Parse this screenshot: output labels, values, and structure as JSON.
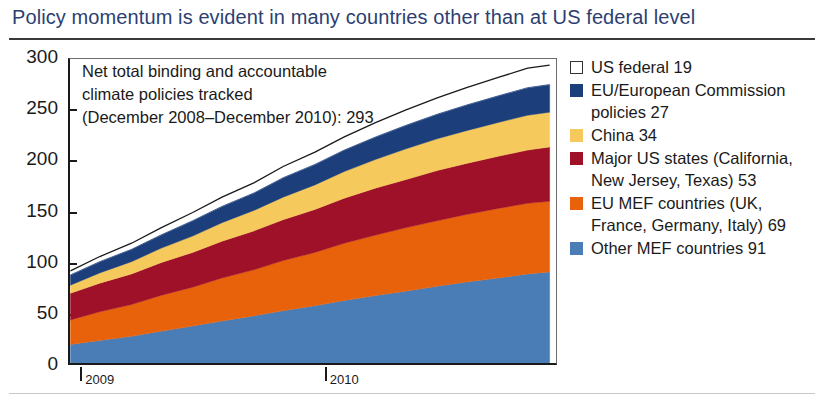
{
  "header": {
    "title": "Policy momentum is evident in many countries other than at US federal level",
    "title_color": "#2d3f72"
  },
  "annotation": {
    "line1": "Net total binding and accountable",
    "line2": "climate policies tracked",
    "line3": "(December 2008–December 2010): 293"
  },
  "legend": {
    "items": [
      {
        "label": "US federal 19",
        "color": "#ffffff",
        "outlined": true,
        "lines": [
          "US federal 19"
        ]
      },
      {
        "label": "EU/European Commission policies 27",
        "color": "#1c3f7c",
        "outlined": false,
        "lines": [
          "EU/European Commission",
          "policies 27"
        ]
      },
      {
        "label": "China 34",
        "color": "#f5c95c",
        "outlined": false,
        "lines": [
          "China 34"
        ]
      },
      {
        "label": "Major US states (California, New Jersey, Texas) 53",
        "color": "#9e1128",
        "outlined": false,
        "lines": [
          "Major US states (California,",
          "New Jersey, Texas) 53"
        ]
      },
      {
        "label": "EU MEF countries (UK, France, Germany, Italy) 69",
        "color": "#e8620c",
        "outlined": false,
        "lines": [
          "EU MEF countries (UK,",
          "France, Germany, Italy) 69"
        ]
      },
      {
        "label": "Other MEF countries 91",
        "color": "#4a7cb5",
        "outlined": false,
        "lines": [
          "Other MEF countries 91"
        ]
      }
    ]
  },
  "chart_data": {
    "type": "area",
    "title": "Policy momentum is evident in many countries other than at US federal level",
    "xlabel": "",
    "ylabel": "",
    "ylim": [
      0,
      300
    ],
    "ytick_values": [
      0,
      50,
      100,
      150,
      200,
      250,
      300
    ],
    "ytick_labels": [
      "0",
      "50",
      "100",
      "150",
      "200",
      "250",
      "300"
    ],
    "xtick_labels": [
      "2009",
      "2010"
    ],
    "xtick_positions": [
      2009.0,
      2010.0
    ],
    "xlim": [
      2008.95,
      2010.95
    ],
    "grid": false,
    "legend_position": "right",
    "stacked": true,
    "note": "Cumulative net total binding and accountable climate policies tracked, December 2008 – December 2010; total 293",
    "x": [
      2008.96,
      2009.08,
      2009.21,
      2009.33,
      2009.46,
      2009.58,
      2009.71,
      2009.83,
      2009.96,
      2010.08,
      2010.21,
      2010.33,
      2010.46,
      2010.58,
      2010.71,
      2010.83,
      2010.92
    ],
    "series": [
      {
        "name": "Other MEF countries",
        "color": "#4a7cb5",
        "final_value": 91,
        "values": [
          20,
          24,
          28,
          33,
          38,
          43,
          48,
          53,
          58,
          63,
          68,
          72,
          77,
          81,
          85,
          89,
          91
        ]
      },
      {
        "name": "EU MEF countries (UK, France, Germany, Italy)",
        "color": "#e8620c",
        "final_value": 69,
        "values": [
          24,
          28,
          31,
          35,
          38,
          42,
          45,
          49,
          52,
          56,
          59,
          62,
          64,
          66,
          68,
          69,
          69
        ]
      },
      {
        "name": "Major US states (California, New Jersey, Texas)",
        "color": "#9e1128",
        "final_value": 53,
        "values": [
          26,
          28,
          30,
          32,
          34,
          36,
          38,
          40,
          42,
          44,
          46,
          47,
          49,
          50,
          51,
          52,
          53
        ]
      },
      {
        "name": "China",
        "color": "#f5c95c",
        "final_value": 34,
        "values": [
          8,
          10,
          12,
          14,
          16,
          18,
          20,
          22,
          24,
          26,
          28,
          30,
          31,
          32,
          33,
          34,
          34
        ]
      },
      {
        "name": "EU/European Commission policies",
        "color": "#1c3f7c",
        "final_value": 27,
        "values": [
          10,
          11,
          12,
          13,
          15,
          16,
          17,
          19,
          20,
          21,
          22,
          23,
          24,
          25,
          26,
          27,
          27
        ]
      },
      {
        "name": "US federal",
        "color": "#ffffff",
        "final_value": 19,
        "values": [
          4,
          5,
          6,
          7,
          8,
          9,
          10,
          11,
          12,
          13,
          14,
          15,
          16,
          17,
          18,
          19,
          19
        ]
      }
    ],
    "totals": [
      92,
      106,
      119,
      134,
      149,
      164,
      178,
      194,
      208,
      223,
      237,
      249,
      261,
      271,
      281,
      290,
      293
    ]
  }
}
